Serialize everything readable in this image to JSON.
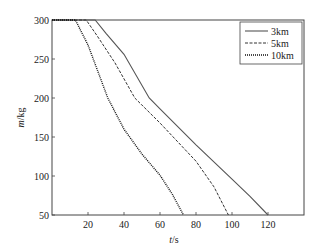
{
  "chart_data": {
    "type": "line",
    "title": "",
    "xlabel": "t/s",
    "xlabel_italic_part": "t",
    "xlabel_unit": "/s",
    "ylabel": "m/kg",
    "ylabel_italic_part": "m",
    "ylabel_unit": "/kg",
    "xlim": [
      0,
      140
    ],
    "ylim": [
      50,
      300
    ],
    "xticks": [
      20,
      40,
      60,
      80,
      100,
      120
    ],
    "yticks": [
      50,
      100,
      150,
      200,
      250,
      300
    ],
    "grid": false,
    "legend_position": "top-right",
    "series": [
      {
        "name": "3km",
        "style": "solid",
        "color": "#555555",
        "points": [
          [
            0,
            300
          ],
          [
            24,
            300
          ],
          [
            30,
            283
          ],
          [
            40,
            256
          ],
          [
            54,
            200
          ],
          [
            60,
            186
          ],
          [
            80,
            140
          ],
          [
            100,
            96
          ],
          [
            110,
            74
          ],
          [
            120,
            50
          ]
        ]
      },
      {
        "name": "5km",
        "style": "dashed",
        "color": "#333333",
        "points": [
          [
            0,
            300
          ],
          [
            19,
            300
          ],
          [
            25,
            280
          ],
          [
            35,
            245
          ],
          [
            46,
            200
          ],
          [
            60,
            168
          ],
          [
            80,
            119
          ],
          [
            90,
            86
          ],
          [
            98,
            50
          ]
        ]
      },
      {
        "name": "10km",
        "style": "dotted",
        "color": "#111111",
        "points": [
          [
            0,
            300
          ],
          [
            13,
            300
          ],
          [
            20,
            268
          ],
          [
            31,
            200
          ],
          [
            40,
            160
          ],
          [
            50,
            128
          ],
          [
            60,
            101
          ],
          [
            67,
            76
          ],
          [
            73,
            50
          ]
        ]
      }
    ]
  }
}
